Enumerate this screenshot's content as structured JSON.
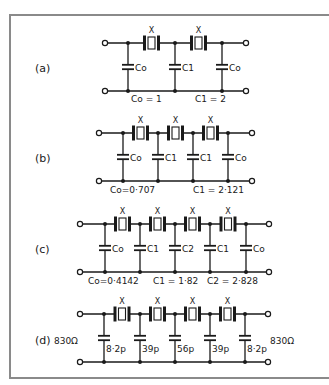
{
  "figure": {
    "panels": [
      {
        "id": "a",
        "label": "(a)",
        "crystal_mark": "X",
        "shunt_caps": [
          "Co",
          "C1",
          "Co"
        ],
        "values": [
          "Co = 1",
          "C1 = 2"
        ]
      },
      {
        "id": "b",
        "label": "(b)",
        "crystal_mark": "X",
        "shunt_caps": [
          "Co",
          "C1",
          "C1",
          "Co"
        ],
        "values": [
          "Co=0·707",
          "C1 = 2·121"
        ]
      },
      {
        "id": "c",
        "label": "(c)",
        "crystal_mark": "X",
        "shunt_caps": [
          "Co",
          "C1",
          "C2",
          "C1",
          "Co"
        ],
        "values": [
          "Co=0·4142",
          "C1 = 1·82",
          "C2 = 2·828"
        ]
      },
      {
        "id": "d",
        "label": "(d)",
        "crystal_mark": "X",
        "shunt_caps": [
          "8·2p",
          "39p",
          "56p",
          "39p",
          "8·2p"
        ],
        "source_impedance": "830Ω",
        "load_impedance": "830Ω"
      }
    ],
    "colors": {
      "ink": "#1a1a1a",
      "frame": "#8a8a8a",
      "background": "#ffffff"
    }
  }
}
